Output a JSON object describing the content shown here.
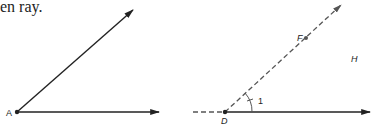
{
  "caption": "en ray.",
  "figures": [
    {
      "name": "angle-A",
      "vertex_label": "A",
      "rays": [
        "diagonal solid ray",
        "horizontal solid ray"
      ]
    },
    {
      "name": "angle-D",
      "vertex_label": "D",
      "point_labels": [
        "F",
        "H"
      ],
      "angle_label": "1",
      "rays": [
        "diagonal dashed ray through F",
        "horizontal solid ray",
        "dashed extension left of D"
      ]
    }
  ],
  "colors": {
    "line": "#222222",
    "dashed": "#555555"
  }
}
